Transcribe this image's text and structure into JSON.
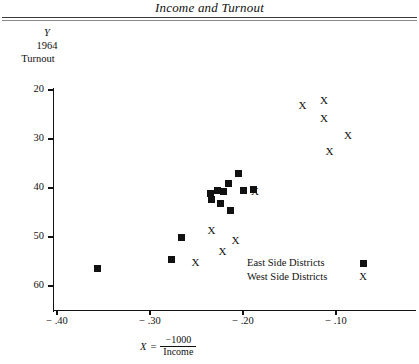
{
  "title": "Income and Turnout",
  "axes": {
    "y_label_lines": [
      "Y",
      "1964",
      "Turnout"
    ],
    "x_label_var": "X",
    "x_label_eq": "=",
    "x_label_numerator": "−1000",
    "x_label_denominator": "Income",
    "y_ticks": [
      "60",
      "50",
      "40",
      "30",
      "20"
    ],
    "x_ticks": [
      "− .40",
      "− .30",
      "− .20",
      "− .10"
    ]
  },
  "legend": {
    "items": [
      {
        "label": "East Side Districts",
        "marker": "square-marker",
        "glyph": "■"
      },
      {
        "label": "West Side Districts",
        "marker": "x-marker",
        "glyph": "X"
      }
    ]
  },
  "chart_data": {
    "type": "scatter",
    "title": "Income and Turnout",
    "xlabel": "X = -1000 / Income",
    "ylabel": "Y 1964 Turnout",
    "xlim": [
      -0.44,
      -0.065
    ],
    "ylim": [
      17.0,
      62.0
    ],
    "xticks": [
      -0.4,
      -0.3,
      -0.2,
      -0.1
    ],
    "yticks": [
      20,
      30,
      40,
      50,
      60
    ],
    "grid": false,
    "legend_position": "lower-right",
    "series": [
      {
        "name": "East Side Districts",
        "marker": "square",
        "points": [
          {
            "x": -0.356,
            "y": 23.6
          },
          {
            "x": -0.277,
            "y": 25.5
          },
          {
            "x": -0.266,
            "y": 30.0
          },
          {
            "x": -0.235,
            "y": 38.8
          },
          {
            "x": -0.234,
            "y": 37.6
          },
          {
            "x": -0.227,
            "y": 39.4
          },
          {
            "x": -0.224,
            "y": 36.9
          },
          {
            "x": -0.221,
            "y": 39.2
          },
          {
            "x": -0.216,
            "y": 41.0
          },
          {
            "x": -0.213,
            "y": 35.5
          },
          {
            "x": -0.205,
            "y": 42.9
          },
          {
            "x": -0.199,
            "y": 39.4
          },
          {
            "x": -0.189,
            "y": 39.6
          }
        ]
      },
      {
        "name": "West Side Districts",
        "marker": "X",
        "points": [
          {
            "x": -0.187,
            "y": 39.2
          },
          {
            "x": -0.234,
            "y": 31.4
          },
          {
            "x": -0.222,
            "y": 27.1
          },
          {
            "x": -0.208,
            "y": 29.3
          },
          {
            "x": -0.251,
            "y": 24.7
          },
          {
            "x": -0.136,
            "y": 56.9
          },
          {
            "x": -0.113,
            "y": 57.8
          },
          {
            "x": -0.113,
            "y": 54.1
          },
          {
            "x": -0.107,
            "y": 47.5
          },
          {
            "x": -0.087,
            "y": 50.8
          }
        ]
      }
    ]
  }
}
